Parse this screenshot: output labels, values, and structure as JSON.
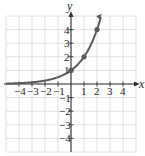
{
  "chart_data": {
    "type": "line",
    "title": "",
    "function": "y = 2^x",
    "xlabel": "x",
    "ylabel": "y",
    "xlim": [
      -5,
      5
    ],
    "ylim": [
      -5,
      5
    ],
    "grid": true,
    "x_ticks": [
      "-4",
      "-3",
      "-2",
      "-1",
      "1",
      "2",
      "3",
      "4"
    ],
    "y_ticks": [
      "4",
      "3",
      "2",
      "1",
      "-1",
      "-2",
      "-3",
      "-4"
    ],
    "series": [
      {
        "name": "exponential curve",
        "x": [
          -5,
          -4,
          -3,
          -2,
          -1,
          0,
          1,
          2,
          2.3
        ],
        "y": [
          0.03,
          0.0625,
          0.125,
          0.25,
          0.5,
          1,
          2,
          4,
          4.92
        ]
      }
    ],
    "marked_points": [
      {
        "x": 0,
        "y": 1
      },
      {
        "x": 1,
        "y": 2
      },
      {
        "x": 2,
        "y": 4
      }
    ],
    "colors": {
      "curve": "#5a5a5a",
      "grid": "#d8d8d8",
      "axis": "#333333"
    }
  }
}
